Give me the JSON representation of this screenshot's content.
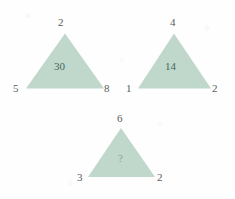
{
  "canvas": {
    "width": 235,
    "height": 199,
    "background_color": "#fefefe"
  },
  "style": {
    "triangle_fill": "#bfd8cb",
    "outer_number_color": "#4a4f4d",
    "inner_number_color": "#41605a",
    "unknown_number_color": "#7f9a92"
  },
  "puzzle": {
    "type": "number-triangle-analogy",
    "triangles": [
      {
        "id": "triangle-1",
        "position": "top-left",
        "apex": "2",
        "bottom_left": "5",
        "bottom_right": "8",
        "center": "30",
        "center_is_unknown": false
      },
      {
        "id": "triangle-2",
        "position": "top-right",
        "apex": "4",
        "bottom_left": "1",
        "bottom_right": "2",
        "center": "14",
        "center_is_unknown": false
      },
      {
        "id": "triangle-3",
        "position": "bottom-center",
        "apex": "6",
        "bottom_left": "3",
        "bottom_right": "2",
        "center": "?",
        "center_is_unknown": true
      }
    ]
  }
}
